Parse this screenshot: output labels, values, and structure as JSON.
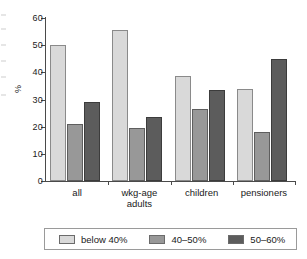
{
  "chart_data": {
    "type": "bar",
    "title": "",
    "subtitle": "",
    "xlabel": "",
    "ylabel": "%",
    "ylim": [
      0,
      60
    ],
    "yticks": [
      0,
      10,
      20,
      30,
      40,
      50,
      60
    ],
    "grid": false,
    "legend_position": "bottom",
    "categories": [
      "all",
      "wkg-age\nadults",
      "children",
      "pensioners"
    ],
    "category_labels": [
      {
        "line1": "all",
        "line2": ""
      },
      {
        "line1": "wkg-age",
        "line2": "adults"
      },
      {
        "line1": "children",
        "line2": ""
      },
      {
        "line1": "pensioners",
        "line2": ""
      }
    ],
    "series": [
      {
        "name": "below 40%",
        "color": "#d9d9d9",
        "values": [
          50.0,
          55.5,
          38.5,
          34.0
        ]
      },
      {
        "name": "40–50%",
        "color": "#989898",
        "values": [
          21.0,
          19.5,
          26.5,
          18.0
        ]
      },
      {
        "name": "50–60%",
        "color": "#5c5c5c",
        "values": [
          29.0,
          23.5,
          33.5,
          45.0
        ]
      }
    ]
  },
  "axis": {
    "y_title": "%",
    "tick_labels": [
      "60",
      "50",
      "40",
      "30",
      "20",
      "10",
      "0"
    ]
  },
  "legend": {
    "entries": [
      {
        "label": "below 40%",
        "color": "#d9d9d9"
      },
      {
        "label": "40–50%",
        "color": "#989898"
      },
      {
        "label": "50–60%",
        "color": "#5c5c5c"
      }
    ]
  }
}
